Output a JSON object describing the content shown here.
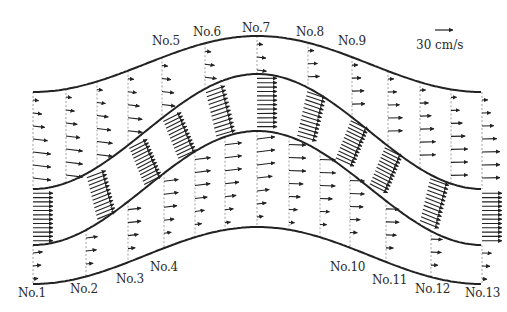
{
  "figure": {
    "scale": {
      "label": "30 cm/s",
      "arrow_length_px": 18
    },
    "colors": {
      "ink": "#222222",
      "dash": "#8a8a8a",
      "background": "#ffffff"
    },
    "section_labels": [
      {
        "id": "No.1",
        "x": 18,
        "y": 286
      },
      {
        "id": "No.2",
        "x": 70,
        "y": 282
      },
      {
        "id": "No.3",
        "x": 116,
        "y": 272
      },
      {
        "id": "No.4",
        "x": 150,
        "y": 260
      },
      {
        "id": "No.5",
        "x": 152,
        "y": 34
      },
      {
        "id": "No.6",
        "x": 193,
        "y": 25
      },
      {
        "id": "No.7",
        "x": 242,
        "y": 21
      },
      {
        "id": "No.8",
        "x": 296,
        "y": 25
      },
      {
        "id": "No.9",
        "x": 338,
        "y": 34
      },
      {
        "id": "No.10",
        "x": 330,
        "y": 260
      },
      {
        "id": "No.11",
        "x": 372,
        "y": 273
      },
      {
        "id": "No.12",
        "x": 415,
        "y": 282
      },
      {
        "id": "No.13",
        "x": 465,
        "y": 286
      }
    ],
    "boundaries": [
      {
        "name": "floodplain-top-bank",
        "y_end": 92,
        "y_peak": 36
      },
      {
        "name": "channel-upper-bank",
        "y_end": 189,
        "y_peak": 74
      },
      {
        "name": "channel-lower-bank",
        "y_end": 245,
        "y_peak": 131
      },
      {
        "name": "floodplain-bottom-bank",
        "y_end": 284,
        "y_peak": 227
      }
    ],
    "x_range": [
      33,
      482
    ],
    "upper_floodplain_lines_x": [
      33,
      66,
      97,
      128,
      162,
      205,
      257,
      308,
      352,
      388,
      420,
      451,
      482
    ],
    "lower_floodplain_lines_x": [
      33,
      86,
      128,
      164,
      195,
      225,
      257,
      289,
      320,
      350,
      386,
      431,
      482
    ]
  }
}
